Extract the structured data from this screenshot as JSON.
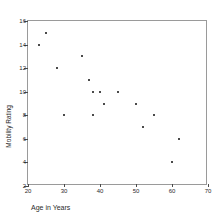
{
  "chart_data": {
    "type": "scatter",
    "title": "",
    "xlabel": "Age in Years",
    "ylabel": "Mobility Rating",
    "xlim": [
      20,
      70
    ],
    "ylim": [
      2,
      16
    ],
    "xticks": [
      20,
      30,
      40,
      50,
      60,
      70
    ],
    "yticks": [
      2,
      4,
      6,
      8,
      10,
      12,
      14,
      16
    ],
    "grid": false,
    "legend": null,
    "marker_color": "#4a4a4a",
    "frame_color": "#9a9a9a",
    "points": [
      {
        "x": 23,
        "y": 14
      },
      {
        "x": 25,
        "y": 15
      },
      {
        "x": 28,
        "y": 12
      },
      {
        "x": 30,
        "y": 8
      },
      {
        "x": 35,
        "y": 13
      },
      {
        "x": 37,
        "y": 11
      },
      {
        "x": 38,
        "y": 10
      },
      {
        "x": 38,
        "y": 8
      },
      {
        "x": 40,
        "y": 10
      },
      {
        "x": 41,
        "y": 9
      },
      {
        "x": 45,
        "y": 10
      },
      {
        "x": 50,
        "y": 9
      },
      {
        "x": 52,
        "y": 7
      },
      {
        "x": 55,
        "y": 8
      },
      {
        "x": 60,
        "y": 4
      },
      {
        "x": 62,
        "y": 6
      }
    ]
  },
  "axes": {
    "x": {
      "label": "Age in Years",
      "tick_labels": [
        "20",
        "30",
        "40",
        "50",
        "60",
        "70"
      ]
    },
    "y": {
      "label": "Mobility Rating",
      "tick_labels": [
        "2",
        "4",
        "6",
        "8",
        "10",
        "12",
        "14",
        "16"
      ]
    }
  }
}
